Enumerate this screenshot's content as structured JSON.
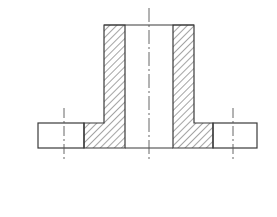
{
  "diagram": {
    "type": "technical-drawing-section-view",
    "colors": {
      "background": "#ffffff",
      "line": "#3a3a3a",
      "hatch": "#4a4a4a",
      "centerline": "#555555"
    },
    "geometry": {
      "hub": {
        "outer_left": 104,
        "inner_left": 125,
        "inner_right": 173,
        "outer_right": 194,
        "top": 25
      },
      "flange": {
        "left": 38,
        "right": 257,
        "top": 123,
        "bottom": 148
      },
      "hatch_extent": {
        "left": 84,
        "right": 213
      },
      "centerlines": [
        {
          "name": "main-axis",
          "x": 149,
          "y1": 8,
          "y2": 160
        },
        {
          "name": "left-bolt-hole-axis",
          "x": 64,
          "y1": 108,
          "y2": 162
        },
        {
          "name": "right-bolt-hole-axis",
          "x": 233,
          "y1": 108,
          "y2": 162
        }
      ]
    }
  }
}
